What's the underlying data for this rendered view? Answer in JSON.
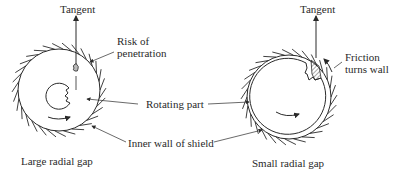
{
  "left_panel": {
    "tangent_label": "Tangent",
    "risk_label_line1": "Risk of",
    "risk_label_line2": "penetration",
    "caption": "Large radial gap"
  },
  "right_panel": {
    "tangent_label": "Tangent",
    "friction_label_line1": "Friction",
    "friction_label_line2": "turns wall",
    "caption": "Small radial gap"
  },
  "shared_labels": {
    "rotating_part": "Rotating part",
    "inner_wall": "Inner wall of shield"
  },
  "colors": {
    "stroke": "#2a2a2a",
    "background": "#ffffff"
  }
}
